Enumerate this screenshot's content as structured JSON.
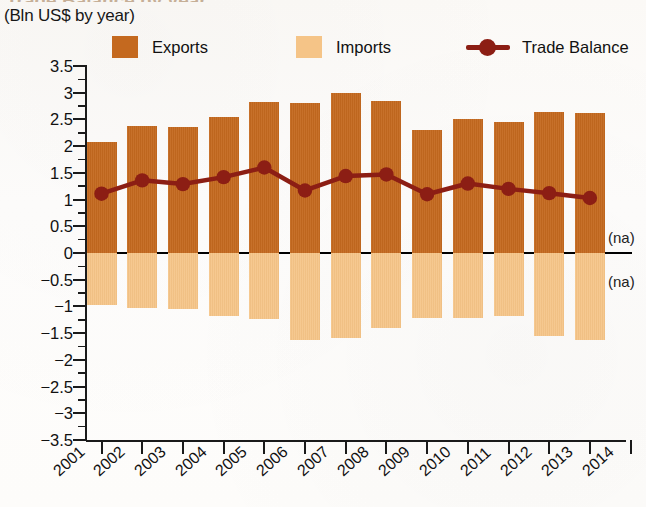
{
  "title_remnant": "Trade Balance by year",
  "subtitle": "(Bln US$ by year)",
  "legend": {
    "exports": {
      "label": "Exports",
      "color": "#C4691F"
    },
    "imports": {
      "label": "Imports",
      "color": "#F5C487"
    },
    "balance": {
      "label": "Trade Balance",
      "color": "#8C1E14"
    }
  },
  "annotations": {
    "na_above": "(na)",
    "na_below": "(na)"
  },
  "chart_data": {
    "type": "bar",
    "title": "(Bln US$ by year)",
    "xlabel": "",
    "ylabel": "Bln US$",
    "ylim": [
      -3.5,
      3.5
    ],
    "ytick_labels": [
      "3.5",
      "3",
      "2.5",
      "2",
      "1.5",
      "1",
      "0.5",
      "0",
      "−0.5",
      "−1",
      "−1.5",
      "−2",
      "−2.5",
      "−3",
      "−3.5"
    ],
    "ytick_values": [
      3.5,
      3,
      2.5,
      2,
      1.5,
      1,
      0.5,
      0,
      -0.5,
      -1,
      -1.5,
      -2,
      -2.5,
      -3,
      -3.5
    ],
    "grid": false,
    "legend_position": "top",
    "categories": [
      "2001",
      "2002",
      "2003",
      "2004",
      "2005",
      "2006",
      "2007",
      "2008",
      "2009",
      "2010",
      "2011",
      "2012",
      "2013",
      "2014"
    ],
    "series": [
      {
        "name": "Exports",
        "type": "bar",
        "color": "#C4691F",
        "values": [
          2.08,
          2.37,
          2.35,
          2.55,
          2.82,
          2.8,
          3.0,
          2.85,
          2.3,
          2.5,
          2.46,
          2.63,
          2.62,
          null
        ]
      },
      {
        "name": "Imports",
        "type": "bar",
        "color": "#F5C487",
        "values": [
          -0.98,
          -1.03,
          -1.05,
          -1.17,
          -1.23,
          -1.62,
          -1.6,
          -1.4,
          -1.22,
          -1.22,
          -1.18,
          -1.55,
          -1.62,
          null
        ]
      },
      {
        "name": "Trade Balance",
        "type": "line",
        "color": "#8C1E14",
        "values": [
          1.11,
          1.36,
          1.29,
          1.42,
          1.6,
          1.17,
          1.44,
          1.47,
          1.1,
          1.3,
          1.2,
          1.12,
          1.03,
          null
        ]
      }
    ]
  }
}
